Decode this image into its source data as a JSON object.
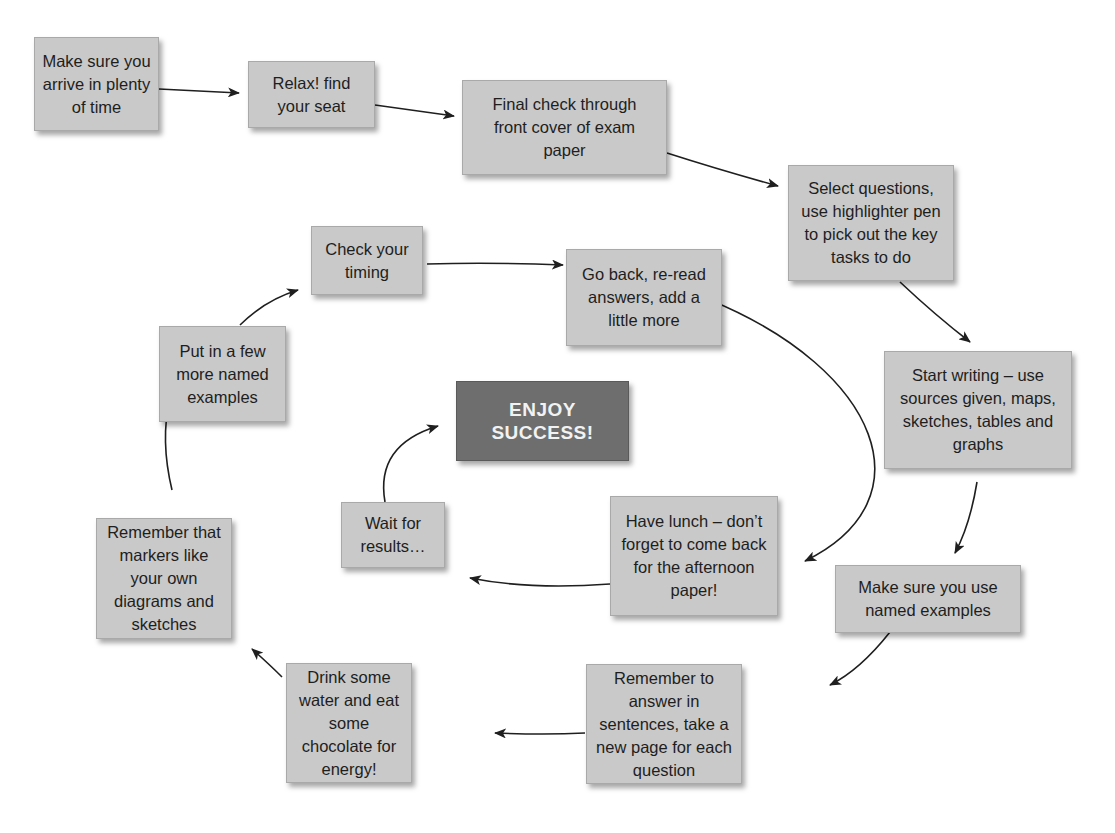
{
  "diagram": {
    "type": "exam-day flow cycle",
    "nodes": [
      {
        "id": "arrive",
        "label": "Make sure you arrive in plenty of time"
      },
      {
        "id": "seat",
        "label": "Relax! find your seat"
      },
      {
        "id": "front-cover",
        "label": "Final check through front cover of exam paper"
      },
      {
        "id": "select",
        "label": "Select questions, use highlighter pen to pick out the key tasks to do"
      },
      {
        "id": "start-writing",
        "label": "Start writing – use sources given, maps, sketches, tables and graphs"
      },
      {
        "id": "named-examples",
        "label": "Make sure you use named examples"
      },
      {
        "id": "sentences",
        "label": "Remember to answer in sentences, take a new page for each question"
      },
      {
        "id": "water",
        "label": "Drink some water and eat some chocolate for energy!"
      },
      {
        "id": "markers",
        "label": "Remember that markers like your own diagrams and sketches"
      },
      {
        "id": "more-examples",
        "label": "Put in a few more named examples"
      },
      {
        "id": "timing",
        "label": "Check your timing"
      },
      {
        "id": "go-back",
        "label": "Go back, re-read answers, add a little more"
      },
      {
        "id": "lunch",
        "label": "Have lunch – don’t forget to come back for the afternoon paper!"
      },
      {
        "id": "wait",
        "label": "Wait for results…"
      },
      {
        "id": "success",
        "label": "ENJOY SUCCESS!"
      }
    ],
    "edges": [
      [
        "arrive",
        "seat"
      ],
      [
        "seat",
        "front-cover"
      ],
      [
        "front-cover",
        "select"
      ],
      [
        "select",
        "start-writing"
      ],
      [
        "start-writing",
        "named-examples"
      ],
      [
        "named-examples",
        "sentences"
      ],
      [
        "sentences",
        "water"
      ],
      [
        "water",
        "markers"
      ],
      [
        "markers",
        "more-examples"
      ],
      [
        "more-examples",
        "timing"
      ],
      [
        "timing",
        "go-back"
      ],
      [
        "go-back",
        "lunch"
      ],
      [
        "lunch",
        "wait"
      ],
      [
        "wait",
        "success"
      ]
    ],
    "colors": {
      "box": "#c9c9c9",
      "success_box": "#6e6e6e",
      "arrow": "#1f1f1f"
    }
  }
}
